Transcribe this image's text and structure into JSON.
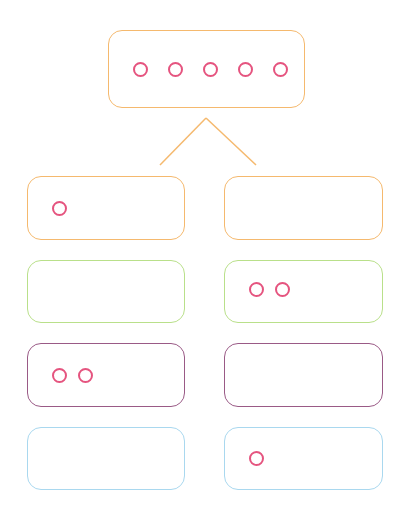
{
  "diagram": {
    "type": "tree-decomposition",
    "colors": {
      "dot": "#e5547f",
      "connector": "#f5b96e"
    },
    "root": {
      "border": "#f5b96e",
      "dots": 5
    },
    "rows": [
      {
        "border": "#f5b96e",
        "left_dots": 1,
        "right_dots": 0
      },
      {
        "border": "#b9e08a",
        "left_dots": 0,
        "right_dots": 2
      },
      {
        "border": "#9a5a86",
        "left_dots": 2,
        "right_dots": 0
      },
      {
        "border": "#a9d8ef",
        "left_dots": 0,
        "right_dots": 1
      }
    ]
  }
}
